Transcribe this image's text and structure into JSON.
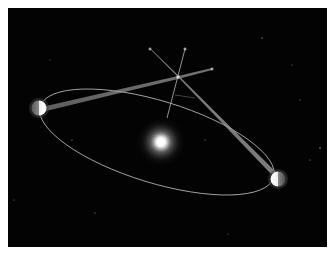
{
  "diagram": {
    "type": "stellar-parallax-illustration",
    "background_color": "#030303",
    "frame_color": "#ffffff",
    "elements": {
      "sun": {
        "label": "",
        "x": 161,
        "y": 142,
        "color": "#ffffff"
      },
      "orbit": {
        "cx": 157,
        "cy": 142,
        "rx": 121,
        "ry": 40,
        "rotation_deg": 17,
        "color": "#cfcfcf"
      },
      "earth_positions": [
        {
          "label": "",
          "x": 39,
          "y": 108
        },
        {
          "label": "",
          "x": 278,
          "y": 179
        }
      ],
      "nearby_star": {
        "label": "",
        "x": 178,
        "y": 77
      },
      "background_stars": [
        {
          "label": "",
          "x": 150,
          "y": 49
        },
        {
          "label": "",
          "x": 185,
          "y": 49
        },
        {
          "label": "",
          "x": 212,
          "y": 69
        }
      ],
      "sight_lines": [
        {
          "from": "earth_left",
          "to": "background_star_3"
        },
        {
          "from": "earth_right",
          "to": "background_star_1"
        },
        {
          "from": "sun",
          "to": "background_star_2"
        }
      ]
    },
    "text_labels": []
  }
}
